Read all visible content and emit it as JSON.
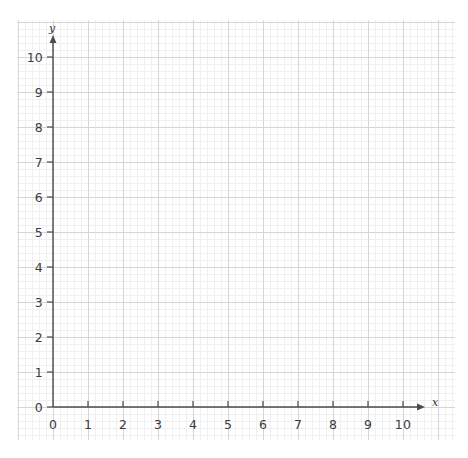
{
  "chart_data": {
    "type": "scatter",
    "title": "",
    "subtitle": "",
    "xlabel": "x",
    "ylabel": "y",
    "xlim": [
      0,
      10
    ],
    "ylim": [
      0,
      10
    ],
    "x_ticks": [
      "0",
      "1",
      "2",
      "3",
      "4",
      "5",
      "6",
      "7",
      "8",
      "9",
      "10"
    ],
    "y_ticks": [
      "0",
      "1",
      "2",
      "3",
      "4",
      "5",
      "6",
      "7",
      "8",
      "9",
      "10"
    ],
    "x_tick_values": [
      0,
      1,
      2,
      3,
      4,
      5,
      6,
      7,
      8,
      9,
      10
    ],
    "y_tick_values": [
      0,
      1,
      2,
      3,
      4,
      5,
      6,
      7,
      8,
      9,
      10
    ],
    "series": [
      {
        "name": "",
        "x": [],
        "y": []
      }
    ],
    "grid": true,
    "grid_minor": true,
    "minor_divisions_per_unit": 5,
    "legend": null,
    "annotations": [],
    "axis_arrows": true
  },
  "colors": {
    "background": "#ffffff",
    "grid_major": "#d0d0d4",
    "grid_minor": "#eceef0",
    "axis": "#4a4a4f",
    "tick_label": "#3b3b3f",
    "axis_name": "#2e2e32"
  },
  "geometry": {
    "origin_x": 53,
    "origin_y": 407,
    "unit_px": 35,
    "paper_left": 17,
    "paper_top": 20,
    "paper_width": 438,
    "paper_height": 420
  }
}
